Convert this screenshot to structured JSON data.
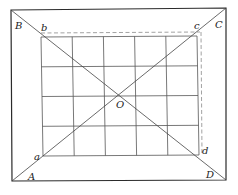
{
  "diagram": {
    "type": "geometry-figure",
    "colors": {
      "outer_stroke": "#2b2b2b",
      "grid_stroke": "#555555",
      "diagonal_stroke": "#444444",
      "dashed_stroke": "#8a8a8a",
      "label": "#222222"
    },
    "outer_vertices": {
      "A": {
        "label": "A",
        "x": 12,
        "y": 181
      },
      "B": {
        "label": "B",
        "x": 11,
        "y": 10
      },
      "C": {
        "label": "C",
        "x": 226,
        "y": 8
      },
      "D": {
        "label": "D",
        "x": 226,
        "y": 180
      }
    },
    "inner_vertices": {
      "a": {
        "label": "a",
        "x": 43,
        "y": 156
      },
      "b": {
        "label": "b",
        "x": 41,
        "y": 35
      },
      "c": {
        "label": "c",
        "x": 199,
        "y": 32
      },
      "d": {
        "label": "d",
        "x": 199,
        "y": 156
      }
    },
    "center": {
      "label": "O",
      "x": 122,
      "y": 95
    },
    "grid": {
      "columns": 5,
      "rows": 4
    },
    "labels": {
      "A": "A",
      "B": "B",
      "C": "C",
      "D": "D",
      "a": "a",
      "b": "b",
      "c": "c",
      "d": "d",
      "O": "O"
    }
  }
}
